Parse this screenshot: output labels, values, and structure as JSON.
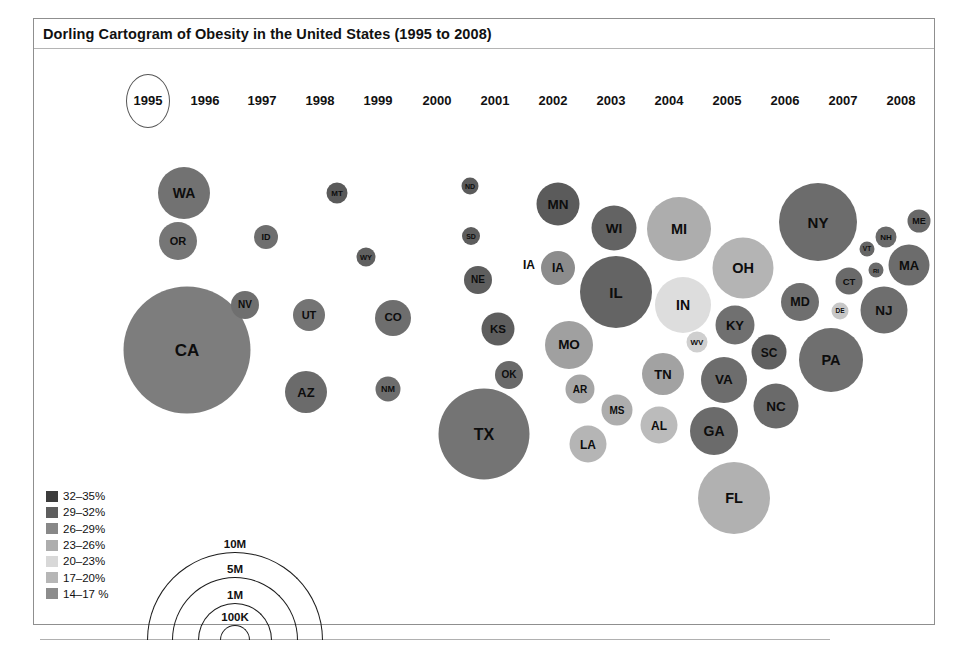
{
  "title": "Dorling Cartogram of Obesity in the United States (1995 to 2008)",
  "timeline": {
    "selected_year": "1995",
    "years": [
      {
        "label": "1995",
        "x": 148
      },
      {
        "label": "1996",
        "x": 205
      },
      {
        "label": "1997",
        "x": 262
      },
      {
        "label": "1998",
        "x": 320
      },
      {
        "label": "1999",
        "x": 378
      },
      {
        "label": "2000",
        "x": 437
      },
      {
        "label": "2001",
        "x": 495
      },
      {
        "label": "2002",
        "x": 553
      },
      {
        "label": "2003",
        "x": 611
      },
      {
        "label": "2004",
        "x": 669
      },
      {
        "label": "2005",
        "x": 727
      },
      {
        "label": "2006",
        "x": 785
      },
      {
        "label": "2007",
        "x": 843
      },
      {
        "label": "2008",
        "x": 901
      }
    ]
  },
  "color_legend": {
    "items": [
      {
        "label": "32–35%",
        "color": "#3c3c3c"
      },
      {
        "label": "29–32%",
        "color": "#5e5e5e"
      },
      {
        "label": "26–29%",
        "color": "#888888"
      },
      {
        "label": "23–26%",
        "color": "#adadad"
      },
      {
        "label": "20–23%",
        "color": "#d8d8d8"
      },
      {
        "label": "17–20%",
        "color": "#b6b6b6"
      },
      {
        "label": "14–17 %",
        "color": "#8c8c8c"
      }
    ]
  },
  "size_legend": {
    "items": [
      {
        "label": "10M",
        "d": 176
      },
      {
        "label": "5M",
        "d": 126
      },
      {
        "label": "1M",
        "d": 74
      },
      {
        "label": "100K",
        "d": 30
      }
    ]
  },
  "stray_labels": [
    {
      "text": "IA",
      "x": 529,
      "y": 265
    }
  ],
  "chart_data": {
    "type": "scatter",
    "title": "Dorling Cartogram of Obesity in the United States (1995 to 2008)",
    "subtitle": "Year 1995 selected",
    "xlabel": "",
    "ylabel": "",
    "encoding": {
      "size": "State population (100K – 10M)",
      "color": "Adult obesity rate (14% – 35%)"
    },
    "legend_position": "bottom-left",
    "grid": false,
    "states": [
      {
        "code": "WA",
        "x": 184,
        "y": 193,
        "d": 52,
        "color": "#727272",
        "rate_band": "26–29%",
        "font": 14
      },
      {
        "code": "OR",
        "x": 178,
        "y": 241,
        "d": 38,
        "color": "#767676",
        "rate_band": "26–29%",
        "font": 11
      },
      {
        "code": "CA",
        "x": 187,
        "y": 350,
        "d": 127,
        "color": "#7d7d7d",
        "rate_band": "26–29%",
        "font": 17
      },
      {
        "code": "NV",
        "x": 245,
        "y": 305,
        "d": 28,
        "color": "#6f6f6f",
        "rate_band": "26–29%",
        "font": 10
      },
      {
        "code": "ID",
        "x": 266,
        "y": 237,
        "d": 24,
        "color": "#6e6e6e",
        "rate_band": "26–29%",
        "font": 9
      },
      {
        "code": "MT",
        "x": 337,
        "y": 193,
        "d": 21,
        "color": "#5a5a5a",
        "rate_band": "29–32%",
        "font": 8
      },
      {
        "code": "WY",
        "x": 366,
        "y": 257,
        "d": 19,
        "color": "#606060",
        "rate_band": "29–32%",
        "font": 7.5
      },
      {
        "code": "UT",
        "x": 309,
        "y": 315,
        "d": 32,
        "color": "#747474",
        "rate_band": "26–29%",
        "font": 11
      },
      {
        "code": "AZ",
        "x": 306,
        "y": 392,
        "d": 42,
        "color": "#6b6b6b",
        "rate_band": "26–29%",
        "font": 13
      },
      {
        "code": "CO",
        "x": 393,
        "y": 318,
        "d": 36,
        "color": "#6e6e6e",
        "rate_band": "26–29%",
        "font": 11.5
      },
      {
        "code": "NM",
        "x": 388,
        "y": 389,
        "d": 25,
        "color": "#6d6d6d",
        "rate_band": "26–29%",
        "font": 9
      },
      {
        "code": "ND",
        "x": 470,
        "y": 186,
        "d": 17,
        "color": "#5b5b5b",
        "rate_band": "29–32%",
        "font": 7
      },
      {
        "code": "SD",
        "x": 471,
        "y": 236,
        "d": 18,
        "color": "#5d5d5d",
        "rate_band": "29–32%",
        "font": 7
      },
      {
        "code": "NE",
        "x": 478,
        "y": 280,
        "d": 28,
        "color": "#5e5e5e",
        "rate_band": "29–32%",
        "font": 10
      },
      {
        "code": "KS",
        "x": 498,
        "y": 329,
        "d": 33,
        "color": "#5e5e5e",
        "rate_band": "29–32%",
        "font": 11.5
      },
      {
        "code": "OK",
        "x": 509,
        "y": 375,
        "d": 28,
        "color": "#6a6a6a",
        "rate_band": "26–29%",
        "font": 10
      },
      {
        "code": "TX",
        "x": 484,
        "y": 434,
        "d": 91,
        "color": "#747474",
        "rate_band": "26–29%",
        "font": 16
      },
      {
        "code": "MN",
        "x": 558,
        "y": 204,
        "d": 43,
        "color": "#5b5b5b",
        "rate_band": "29–32%",
        "font": 13.5
      },
      {
        "code": "IA",
        "x": 558,
        "y": 268,
        "d": 34,
        "color": "#8c8c8c",
        "rate_band": "23–26%",
        "font": 12
      },
      {
        "code": "MO",
        "x": 569,
        "y": 345,
        "d": 48,
        "color": "#a0a0a0",
        "rate_band": "23–26%",
        "font": 13.5
      },
      {
        "code": "AR",
        "x": 580,
        "y": 389,
        "d": 29,
        "color": "#a6a6a6",
        "rate_band": "23–26%",
        "font": 10
      },
      {
        "code": "MS",
        "x": 617,
        "y": 410,
        "d": 31,
        "color": "#adadad",
        "rate_band": "23–26%",
        "font": 10
      },
      {
        "code": "LA",
        "x": 588,
        "y": 444,
        "d": 37,
        "color": "#b5b5b5",
        "rate_band": "23–26%",
        "font": 12
      },
      {
        "code": "WI",
        "x": 614,
        "y": 228,
        "d": 45,
        "color": "#636363",
        "rate_band": "29–32%",
        "font": 13.5
      },
      {
        "code": "IL",
        "x": 616,
        "y": 292,
        "d": 72,
        "color": "#646464",
        "rate_band": "29–32%",
        "font": 15
      },
      {
        "code": "TN",
        "x": 663,
        "y": 374,
        "d": 42,
        "color": "#a2a2a2",
        "rate_band": "23–26%",
        "font": 13
      },
      {
        "code": "AL",
        "x": 659,
        "y": 425,
        "d": 37,
        "color": "#bbbbbb",
        "rate_band": "23–26%",
        "font": 12
      },
      {
        "code": "MI",
        "x": 679,
        "y": 229,
        "d": 64,
        "color": "#adadad",
        "rate_band": "23–26%",
        "font": 14.5
      },
      {
        "code": "IN",
        "x": 683,
        "y": 305,
        "d": 56,
        "color": "#dddddd",
        "rate_band": "20–23%",
        "font": 14
      },
      {
        "code": "WV",
        "x": 697,
        "y": 342,
        "d": 21,
        "color": "#cfcfcf",
        "rate_band": "20–23%",
        "font": 8
      },
      {
        "code": "GA",
        "x": 714,
        "y": 431,
        "d": 48,
        "color": "#6b6b6b",
        "rate_band": "26–29%",
        "font": 14
      },
      {
        "code": "FL",
        "x": 734,
        "y": 498,
        "d": 72,
        "color": "#b1b1b1",
        "rate_band": "23–26%",
        "font": 14.5
      },
      {
        "code": "KY",
        "x": 735,
        "y": 325,
        "d": 39,
        "color": "#707070",
        "rate_band": "26–29%",
        "font": 13
      },
      {
        "code": "VA",
        "x": 724,
        "y": 380,
        "d": 46,
        "color": "#6d6d6d",
        "rate_band": "26–29%",
        "font": 13.5
      },
      {
        "code": "OH",
        "x": 743,
        "y": 268,
        "d": 61,
        "color": "#b4b4b4",
        "rate_band": "23–26%",
        "font": 14.5
      },
      {
        "code": "SC",
        "x": 769,
        "y": 352,
        "d": 35,
        "color": "#616161",
        "rate_band": "29–32%",
        "font": 12
      },
      {
        "code": "NC",
        "x": 776,
        "y": 406,
        "d": 45,
        "color": "#6a6a6a",
        "rate_band": "26–29%",
        "font": 13.5
      },
      {
        "code": "MD",
        "x": 800,
        "y": 302,
        "d": 38,
        "color": "#6f6f6f",
        "rate_band": "26–29%",
        "font": 12.5
      },
      {
        "code": "NY",
        "x": 818,
        "y": 222,
        "d": 78,
        "color": "#6c6c6c",
        "rate_band": "26–29%",
        "font": 15
      },
      {
        "code": "PA",
        "x": 831,
        "y": 360,
        "d": 64,
        "color": "#6f6f6f",
        "rate_band": "26–29%",
        "font": 14.5
      },
      {
        "code": "DE",
        "x": 840,
        "y": 311,
        "d": 17,
        "color": "#c7c7c7",
        "rate_band": "20–23%",
        "font": 6.5
      },
      {
        "code": "CT",
        "x": 849,
        "y": 281,
        "d": 27,
        "color": "#6a6a6a",
        "rate_band": "26–29%",
        "font": 9.5
      },
      {
        "code": "VT",
        "x": 867,
        "y": 249,
        "d": 15,
        "color": "#666666",
        "rate_band": "29–32%",
        "font": 6.5
      },
      {
        "code": "RI",
        "x": 876,
        "y": 270,
        "d": 15,
        "color": "#6b6b6b",
        "rate_band": "26–29%",
        "font": 6
      },
      {
        "code": "NH",
        "x": 886,
        "y": 237,
        "d": 21,
        "color": "#6a6a6a",
        "rate_band": "26–29%",
        "font": 8
      },
      {
        "code": "ME",
        "x": 919,
        "y": 221,
        "d": 23,
        "color": "#686868",
        "rate_band": "26–29%",
        "font": 9
      },
      {
        "code": "MA",
        "x": 909,
        "y": 265,
        "d": 41,
        "color": "#6c6c6c",
        "rate_band": "26–29%",
        "font": 13
      },
      {
        "code": "NJ",
        "x": 884,
        "y": 310,
        "d": 47,
        "color": "#6e6e6e",
        "rate_band": "26–29%",
        "font": 13.5
      }
    ]
  }
}
